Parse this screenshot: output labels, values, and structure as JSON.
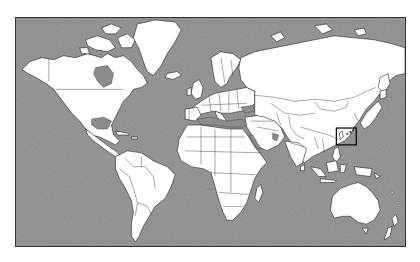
{
  "map": {
    "projection": "Mercator",
    "style": "grayscale",
    "ocean_color": "#8a8a8a",
    "land_color": "#ffffff",
    "border_color": "#222222",
    "highlight": {
      "label": "Highlighted region (Taiwan / Ryukyu Islands area)",
      "x": 337,
      "y": 128,
      "width": 20,
      "height": 17,
      "stroke_color": "#000000"
    },
    "continents": [
      {
        "name": "North America"
      },
      {
        "name": "Greenland"
      },
      {
        "name": "South America"
      },
      {
        "name": "Europe"
      },
      {
        "name": "Africa"
      },
      {
        "name": "Asia"
      },
      {
        "name": "Australia"
      },
      {
        "name": "New Zealand"
      }
    ]
  }
}
